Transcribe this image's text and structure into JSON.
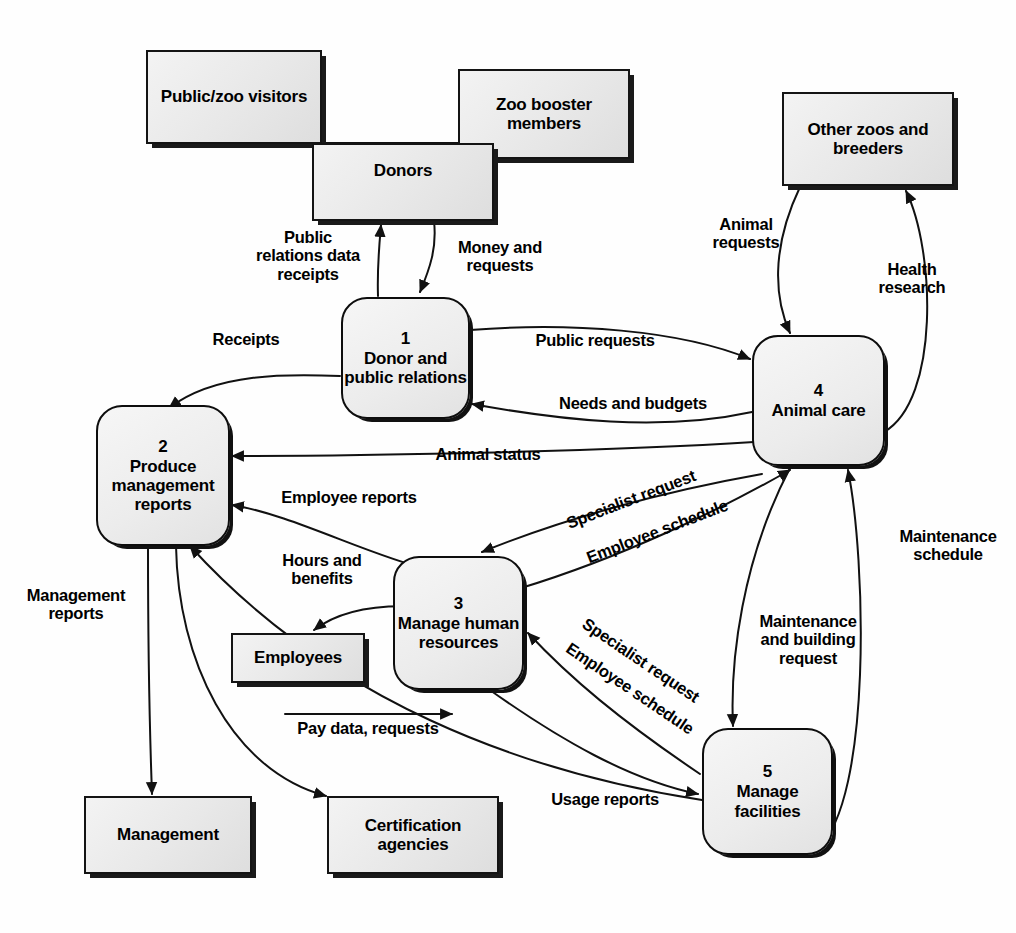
{
  "diagram": {
    "type": "data-flow-diagram"
  },
  "entities": [
    {
      "id": "public_zoo_visitors",
      "label": "Public/zoo\nvisitors"
    },
    {
      "id": "zoo_booster_members",
      "label": "Zoo booster\nmembers"
    },
    {
      "id": "donors",
      "label": "Donors"
    },
    {
      "id": "other_zoos",
      "label": "Other zoos and\nbreeders"
    },
    {
      "id": "employees",
      "label": "Employees"
    },
    {
      "id": "management",
      "label": "Management"
    },
    {
      "id": "certification_agencies",
      "label": "Certification\nagencies"
    }
  ],
  "processes": [
    {
      "id": "p1",
      "number": "1",
      "name": "Donor and\npublic\nrelations"
    },
    {
      "id": "p2",
      "number": "2",
      "name": "Produce\nmanagement\nreports"
    },
    {
      "id": "p3",
      "number": "3",
      "name": "Manage\nhuman\nresources"
    },
    {
      "id": "p4",
      "number": "4",
      "name": "Animal care"
    },
    {
      "id": "p5",
      "number": "5",
      "name": "Manage\nfacilities"
    }
  ],
  "flows": [
    {
      "id": "f_public_relations_data",
      "label": "Public\nrelations data\nreceipts",
      "from": "p1",
      "to": "donors"
    },
    {
      "id": "f_money_requests",
      "label": "Money and\nrequests",
      "from": "donors",
      "to": "p1"
    },
    {
      "id": "f_receipts",
      "label": "Receipts",
      "from": "p1",
      "to": "p2"
    },
    {
      "id": "f_public_requests",
      "label": "Public requests",
      "from": "p1",
      "to": "p4"
    },
    {
      "id": "f_needs_budgets",
      "label": "Needs and budgets",
      "from": "p4",
      "to": "p1"
    },
    {
      "id": "f_animal_requests",
      "label": "Animal\nrequests",
      "from": "other_zoos",
      "to": "p4"
    },
    {
      "id": "f_health_research",
      "label": "Health\nresearch",
      "from": "p4",
      "to": "other_zoos"
    },
    {
      "id": "f_animal_status",
      "label": "Animal status",
      "from": "p4",
      "to": "p2"
    },
    {
      "id": "f_employee_reports",
      "label": "Employee reports",
      "from": "p3",
      "to": "p2"
    },
    {
      "id": "f_specialist_request_4",
      "label": "Specialist request",
      "from": "p4",
      "to": "p3"
    },
    {
      "id": "f_employee_schedule_4",
      "label": "Employee schedule",
      "from": "p3",
      "to": "p4"
    },
    {
      "id": "f_hours_benefits",
      "label": "Hours and\nbenefits",
      "from": "p3",
      "to": "employees"
    },
    {
      "id": "f_pay_data_requests",
      "label": "Pay data, requests",
      "from": "employees",
      "to": "p3"
    },
    {
      "id": "f_specialist_request_5",
      "label": "Specialist request",
      "from": "p5",
      "to": "p3"
    },
    {
      "id": "f_employee_schedule_5",
      "label": "Employee schedule",
      "from": "p3",
      "to": "p5"
    },
    {
      "id": "f_maintenance_building_request",
      "label": "Maintenance\nand building\nrequest",
      "from": "p4",
      "to": "p5"
    },
    {
      "id": "f_maintenance_schedule",
      "label": "Maintenance\nschedule",
      "from": "p5",
      "to": "p4"
    },
    {
      "id": "f_usage_reports",
      "label": "Usage reports",
      "from": "p5",
      "to": "p2"
    },
    {
      "id": "f_management_reports",
      "label": "Management\nreports",
      "from": "p2",
      "to": "management"
    }
  ],
  "colors": {
    "stroke": "#111111",
    "entity_fill": "#ececec",
    "process_fill": "#efefef",
    "background": "#ffffff"
  }
}
